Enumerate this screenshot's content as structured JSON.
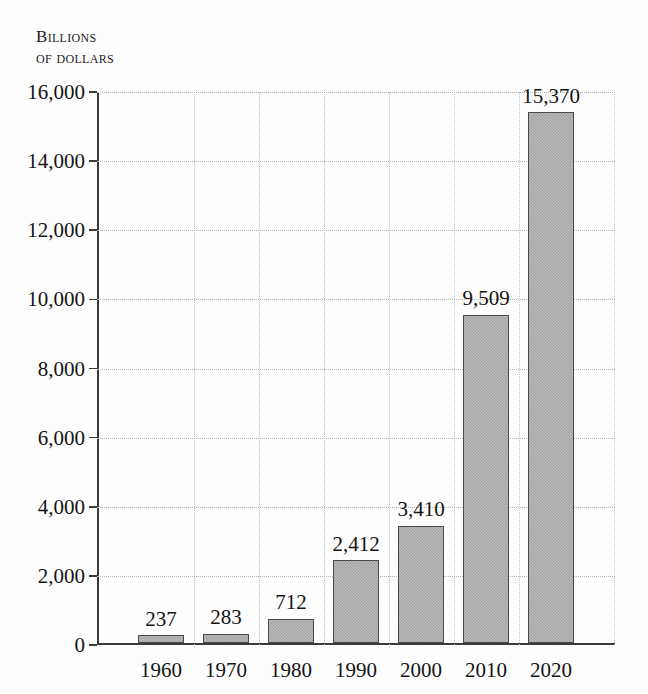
{
  "chart_data": {
    "type": "bar",
    "title": "",
    "subtitle": "",
    "xlabel": "",
    "ylabel": "Billions of dollars",
    "ylabel_lines": [
      "Billions",
      "of dollars"
    ],
    "categories": [
      "1960",
      "1970",
      "1980",
      "1990",
      "2000",
      "2010",
      "2020"
    ],
    "values": [
      237,
      283,
      712,
      2412,
      3410,
      9509,
      15370
    ],
    "value_labels": [
      "237",
      "283",
      "712",
      "2,412",
      "3,410",
      "9,509",
      "15,370"
    ],
    "ylim": [
      0,
      16000
    ],
    "ytick_values": [
      0,
      2000,
      4000,
      6000,
      8000,
      10000,
      12000,
      14000,
      16000
    ],
    "ytick_labels": [
      "0",
      "2,000",
      "4,000",
      "6,000",
      "8,000",
      "10,000",
      "12,000",
      "14,000",
      "16,000"
    ],
    "grid": true,
    "grid_style": "dotted",
    "legend": false,
    "legend_position": "none",
    "bar_color": "#a6a6a6",
    "bar_border_color": "#4a4a4a",
    "grid_color": "#b4b4b4",
    "axis_color": "#3b3b3b",
    "text_color": "#141414",
    "background_color": "#fdfdfd"
  }
}
